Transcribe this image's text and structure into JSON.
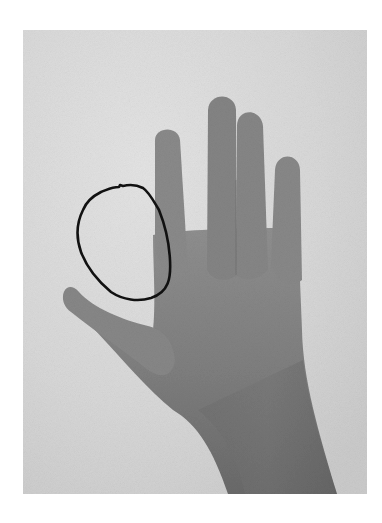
{
  "image": {
    "subject": "grayscale photograph of a left hand, palm-side view, fingers spread",
    "annotation": "hand-drawn black closed outline beside the index finger, above the thumb",
    "colors": {
      "page_background": "#ffffff",
      "photo_background": "#d6d6d6",
      "photo_background_light": "#e2e2e2",
      "skin_light": "#8e8e8e",
      "skin_mid": "#7c7c7c",
      "skin_dark": "#5e5e5e",
      "outline": "#111111"
    },
    "frame": {
      "x": 23,
      "y": 30,
      "width": 344,
      "height": 464
    }
  }
}
